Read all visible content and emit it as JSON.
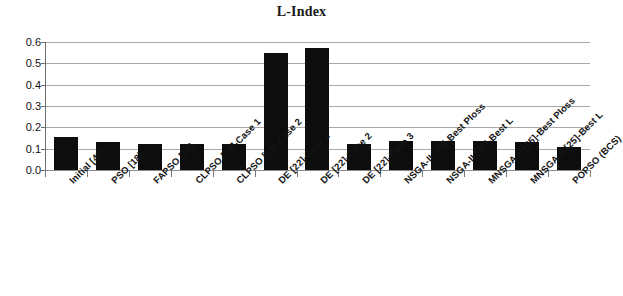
{
  "chart_data": {
    "type": "bar",
    "title": "L-Index",
    "xlabel": "",
    "ylabel": "",
    "ylim": [
      0.0,
      0.6
    ],
    "ytick_labels": [
      "0.6",
      "0.5",
      "0.4",
      "0.3",
      "0.2",
      "0.1",
      "0.0"
    ],
    "ytick_values": [
      0.6,
      0.5,
      0.4,
      0.3,
      0.2,
      0.1,
      0.0
    ],
    "grid": true,
    "legend": null,
    "bar_color": "#0d0d0d",
    "gridline_color": "#a9a9a9",
    "background_color": "#ffffff",
    "categories": [
      "Initial [43]",
      "PSO [18]",
      "FAPSO [18]",
      "CLPSO [19]-Case 1",
      "CLPSO [19]-Case 2",
      "DE [22]-Case 1",
      "DE [22]-Case 2",
      "DE [22]-Case 3",
      "NSGA-II [25]-Best Ploss",
      "NSGA-II [25]-Best L",
      "MNSGA-II [25]-Best Ploss",
      "MNSGA-II [25]-Best L",
      "POPSO (BCS)"
    ],
    "values": [
      0.157,
      0.13,
      0.124,
      0.122,
      0.123,
      0.548,
      0.57,
      0.121,
      0.136,
      0.134,
      0.135,
      0.132,
      0.11
    ]
  }
}
